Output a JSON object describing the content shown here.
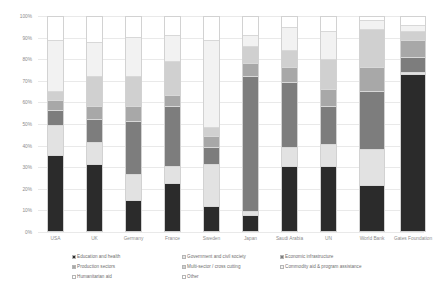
{
  "chart_data": {
    "type": "bar",
    "subtype": "100% stacked column",
    "title": "",
    "xlabel": "",
    "ylabel": "",
    "ylim": [
      0,
      100
    ],
    "ytick_labels": [
      "0%",
      "10%",
      "20%",
      "30%",
      "40%",
      "50%",
      "60%",
      "70%",
      "80%",
      "90%",
      "100%"
    ],
    "ytick_values": [
      0,
      10,
      20,
      30,
      40,
      50,
      60,
      70,
      80,
      90,
      100
    ],
    "grid": true,
    "legend_position": "bottom",
    "categories": [
      "USA",
      "UK",
      "Germany",
      "France",
      "Sweden",
      "Japan",
      "Saudi Arabia",
      "UN",
      "World Bank",
      "Gates Foundation"
    ],
    "series": [
      {
        "name": "Education and health",
        "color": "#2b2b2b",
        "values": [
          35,
          31,
          14,
          22,
          11,
          7,
          30,
          30,
          21,
          73
        ]
      },
      {
        "name": "Government and civil society",
        "color": "#e2e2e2",
        "values": [
          14,
          10,
          12,
          8,
          20,
          2,
          9,
          10,
          17,
          1
        ]
      },
      {
        "name": "Economic infrastructure",
        "color": "#7d7d7d",
        "values": [
          7,
          11,
          25,
          28,
          8,
          63,
          30,
          18,
          27,
          7
        ]
      },
      {
        "name": "Production sectors",
        "color": "#a8a8a8",
        "values": [
          5,
          6,
          7,
          5,
          5,
          6,
          7,
          8,
          11,
          8
        ]
      },
      {
        "name": "Multi-sector / cross cutting",
        "color": "#d0d0d0",
        "values": [
          4,
          14,
          14,
          16,
          4,
          8,
          8,
          14,
          18,
          4
        ]
      },
      {
        "name": "Commodity aid & program assistance",
        "color": "#f2f2f2",
        "values": [
          24,
          16,
          18,
          12,
          41,
          5,
          11,
          13,
          4,
          3
        ]
      },
      {
        "name": "Humanitarian aid",
        "color": "#ffffff",
        "values": [
          11,
          12,
          10,
          9,
          11,
          9,
          5,
          7,
          2,
          4
        ]
      }
    ]
  },
  "legend": {
    "items": [
      {
        "label": "Education and health",
        "color": "#2b2b2b"
      },
      {
        "label": "Government and civil society",
        "color": "#e2e2e2"
      },
      {
        "label": "Economic infrastructure",
        "color": "#7d7d7d"
      },
      {
        "label": "Production sectors",
        "color": "#a8a8a8"
      },
      {
        "label": "Multi-sector / cross cutting",
        "color": "#d0d0d0"
      },
      {
        "label": "Commodity aid & program assistance",
        "color": "#f2f2f2"
      },
      {
        "label": "Humanitarian aid",
        "color": "#ffffff"
      },
      {
        "label": "Other",
        "color": "#ffffff"
      }
    ]
  }
}
